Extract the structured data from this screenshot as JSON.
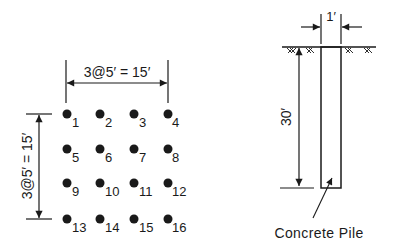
{
  "pile_group": {
    "horizontal_dimension": "3@5′ = 15′",
    "vertical_dimension": "3@5′ = 15′",
    "piles": [
      {
        "id": "1",
        "label": "1",
        "row": 0,
        "col": 0
      },
      {
        "id": "2",
        "label": "2",
        "row": 0,
        "col": 1
      },
      {
        "id": "3",
        "label": "3",
        "row": 0,
        "col": 2
      },
      {
        "id": "4",
        "label": "4",
        "row": 0,
        "col": 3
      },
      {
        "id": "5",
        "label": "5",
        "row": 1,
        "col": 0
      },
      {
        "id": "6",
        "label": "6",
        "row": 1,
        "col": 1
      },
      {
        "id": "7",
        "label": "7",
        "row": 1,
        "col": 2
      },
      {
        "id": "8",
        "label": "8",
        "row": 1,
        "col": 3
      },
      {
        "id": "9",
        "label": "9",
        "row": 2,
        "col": 0
      },
      {
        "id": "10",
        "label": "10",
        "row": 2,
        "col": 1
      },
      {
        "id": "11",
        "label": "11",
        "row": 2,
        "col": 2
      },
      {
        "id": "12",
        "label": "12",
        "row": 2,
        "col": 3
      },
      {
        "id": "13",
        "label": "13",
        "row": 3,
        "col": 0
      },
      {
        "id": "14",
        "label": "14",
        "row": 3,
        "col": 1
      },
      {
        "id": "15",
        "label": "15",
        "row": 3,
        "col": 2
      },
      {
        "id": "16",
        "label": "16",
        "row": 3,
        "col": 3
      }
    ]
  },
  "pile_section": {
    "width_dimension": "1′",
    "length_dimension": "30′",
    "pile_label": "Concrete Pile"
  },
  "colors": {
    "ink": "#1a1a1a",
    "background": "#ffffff"
  }
}
